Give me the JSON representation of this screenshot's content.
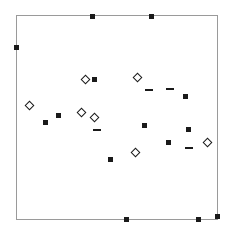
{
  "figure": {
    "width": 235,
    "height": 235,
    "background_color": "#ffffff"
  },
  "plot_frame": {
    "left": 16,
    "top": 15,
    "width": 202,
    "height": 205,
    "border_color": "#9a9a9a",
    "border_width": 1,
    "fill_color": "#ffffff",
    "grid": false,
    "ticks": false,
    "tick_labels": false,
    "axis_labels": false,
    "title": "",
    "legend": false
  },
  "marker_styles": {
    "square": {
      "name": "filled-square",
      "shape": "square",
      "filled": true,
      "color": "#1a1a1a",
      "size_px": 5
    },
    "diamond": {
      "name": "open-diamond",
      "shape": "diamond",
      "filled": false,
      "color": "#1a1a1a",
      "size_px": 7
    },
    "dash": {
      "name": "horizontal-dash",
      "shape": "dash",
      "filled": true,
      "color": "#1a1a1a",
      "size_px": 8
    }
  },
  "chart_data": {
    "type": "scatter",
    "title": "",
    "xlabel": "",
    "ylabel": "",
    "xlim": [
      0,
      235
    ],
    "ylim": [
      0,
      235
    ],
    "grid": false,
    "legend_position": "none",
    "note": "Pixel coordinates measured from the top-left of the 235x235 figure; y increases downward.",
    "series": [
      {
        "name": "filled-square",
        "marker": "square",
        "color": "#1a1a1a",
        "points": [
          {
            "x": 92,
            "y": 16
          },
          {
            "x": 151,
            "y": 16
          },
          {
            "x": 16,
            "y": 47
          },
          {
            "x": 94,
            "y": 79
          },
          {
            "x": 185,
            "y": 96
          },
          {
            "x": 58,
            "y": 115
          },
          {
            "x": 45,
            "y": 122
          },
          {
            "x": 144,
            "y": 125
          },
          {
            "x": 188,
            "y": 129
          },
          {
            "x": 168,
            "y": 142
          },
          {
            "x": 110,
            "y": 159
          },
          {
            "x": 126,
            "y": 219
          },
          {
            "x": 198,
            "y": 219
          },
          {
            "x": 217,
            "y": 216
          }
        ]
      },
      {
        "name": "open-diamond",
        "marker": "diamond",
        "color": "#1a1a1a",
        "points": [
          {
            "x": 137,
            "y": 77
          },
          {
            "x": 85,
            "y": 79
          },
          {
            "x": 29,
            "y": 105
          },
          {
            "x": 81,
            "y": 112
          },
          {
            "x": 94,
            "y": 117
          },
          {
            "x": 207,
            "y": 142
          },
          {
            "x": 135,
            "y": 152
          }
        ]
      },
      {
        "name": "horizontal-dash",
        "marker": "dash",
        "color": "#1a1a1a",
        "points": [
          {
            "x": 149,
            "y": 90
          },
          {
            "x": 170,
            "y": 89
          },
          {
            "x": 97,
            "y": 130
          },
          {
            "x": 189,
            "y": 148
          }
        ]
      }
    ]
  }
}
